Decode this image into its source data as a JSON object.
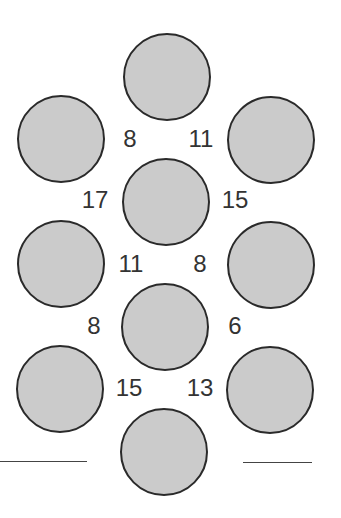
{
  "puzzle": {
    "type": "number-circle-puzzle",
    "circle_diameter": 88,
    "colors": {
      "circle_fill": "#cbcbcb",
      "circle_stroke": "#2a2a2a",
      "number_text": "#333333",
      "answer_line": "#444444",
      "background": "#ffffff"
    },
    "circles": [
      {
        "id": "top",
        "cx": 167,
        "cy": 77
      },
      {
        "id": "upper-left",
        "cx": 61,
        "cy": 139
      },
      {
        "id": "upper-right",
        "cx": 271,
        "cy": 140
      },
      {
        "id": "center-upper",
        "cx": 166,
        "cy": 202
      },
      {
        "id": "middle-left",
        "cx": 61,
        "cy": 264
      },
      {
        "id": "middle-right",
        "cx": 271,
        "cy": 265
      },
      {
        "id": "center-lower",
        "cx": 165,
        "cy": 327
      },
      {
        "id": "lower-left",
        "cx": 60,
        "cy": 389
      },
      {
        "id": "lower-right",
        "cx": 270,
        "cy": 390
      },
      {
        "id": "bottom",
        "cx": 164,
        "cy": 452
      }
    ],
    "numbers": [
      {
        "value": "8",
        "x": 130,
        "y": 139
      },
      {
        "value": "11",
        "x": 201,
        "y": 139
      },
      {
        "value": "17",
        "x": 95,
        "y": 200
      },
      {
        "value": "15",
        "x": 235,
        "y": 200
      },
      {
        "value": "11",
        "x": 131,
        "y": 264
      },
      {
        "value": "8",
        "x": 200,
        "y": 264
      },
      {
        "value": "8",
        "x": 94,
        "y": 326
      },
      {
        "value": "6",
        "x": 235,
        "y": 326
      },
      {
        "value": "15",
        "x": 129,
        "y": 388
      },
      {
        "value": "13",
        "x": 200,
        "y": 388
      }
    ],
    "answer_lines": [
      {
        "id": "left",
        "x": 0,
        "y": 461,
        "width": 87
      },
      {
        "id": "right",
        "x": 243,
        "y": 462,
        "width": 69
      }
    ]
  }
}
